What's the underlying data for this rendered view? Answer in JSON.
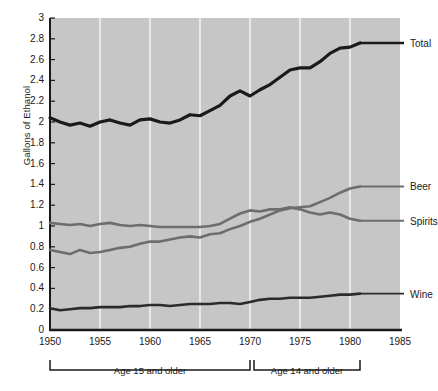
{
  "chart_data": {
    "type": "line",
    "title": "",
    "xlabel": "",
    "ylabel": "Gallons of Ethanol",
    "xlim": [
      1950,
      1985
    ],
    "ylim": [
      0,
      3
    ],
    "grid": "vertical-white-at-5-year-ticks",
    "legend_position": "right-of-line-ends",
    "x_ticks": [
      1950,
      1955,
      1960,
      1965,
      1970,
      1975,
      1980,
      1985
    ],
    "y_ticks": [
      0,
      0.2,
      0.4,
      0.6,
      0.8,
      1,
      1.2,
      1.4,
      1.6,
      1.8,
      2,
      2.2,
      2.4,
      2.6,
      2.8,
      3
    ],
    "y_tick_labels": [
      "0",
      "0.2",
      "0.4",
      "0.6",
      "0.8",
      "1",
      "1.2",
      "1.4",
      "1.6",
      "1.8",
      "2",
      "2.2",
      "2.4",
      "2.6",
      "2.8",
      "3"
    ],
    "x": [
      1950,
      1951,
      1952,
      1953,
      1954,
      1955,
      1956,
      1957,
      1958,
      1959,
      1960,
      1961,
      1962,
      1963,
      1964,
      1965,
      1966,
      1967,
      1968,
      1969,
      1970,
      1971,
      1972,
      1973,
      1974,
      1975,
      1976,
      1977,
      1978,
      1979,
      1980,
      1981
    ],
    "series": [
      {
        "name": "Total",
        "color": "#1a1a1a",
        "width": 3.2,
        "label": "Total",
        "values": [
          2.04,
          2.0,
          1.97,
          1.99,
          1.96,
          2.0,
          2.02,
          1.99,
          1.97,
          2.02,
          2.03,
          2.0,
          1.99,
          2.02,
          2.07,
          2.06,
          2.11,
          2.16,
          2.25,
          2.3,
          2.25,
          2.31,
          2.36,
          2.43,
          2.5,
          2.52,
          2.52,
          2.58,
          2.66,
          2.71,
          2.72,
          2.76
        ]
      },
      {
        "name": "Beer",
        "color": "#6d6d6d",
        "width": 2.6,
        "label": "Beer",
        "values": [
          0.77,
          0.75,
          0.73,
          0.77,
          0.74,
          0.75,
          0.77,
          0.79,
          0.8,
          0.83,
          0.85,
          0.85,
          0.87,
          0.89,
          0.9,
          0.89,
          0.92,
          0.93,
          0.97,
          1.0,
          1.04,
          1.07,
          1.11,
          1.15,
          1.17,
          1.18,
          1.19,
          1.23,
          1.27,
          1.32,
          1.36,
          1.38
        ]
      },
      {
        "name": "Spirits",
        "color": "#6d6d6d",
        "width": 2.6,
        "label": "Spirits",
        "values": [
          1.03,
          1.02,
          1.01,
          1.02,
          1.0,
          1.02,
          1.03,
          1.01,
          1.0,
          1.01,
          1.0,
          0.99,
          0.99,
          0.99,
          0.99,
          0.99,
          1.0,
          1.02,
          1.07,
          1.12,
          1.15,
          1.14,
          1.16,
          1.16,
          1.18,
          1.16,
          1.13,
          1.11,
          1.13,
          1.11,
          1.07,
          1.05
        ]
      },
      {
        "name": "Wine",
        "color": "#2b2b2b",
        "width": 2.6,
        "label": "Wine",
        "values": [
          0.21,
          0.19,
          0.2,
          0.21,
          0.21,
          0.22,
          0.22,
          0.22,
          0.23,
          0.23,
          0.24,
          0.24,
          0.23,
          0.24,
          0.25,
          0.25,
          0.25,
          0.26,
          0.26,
          0.25,
          0.27,
          0.29,
          0.3,
          0.3,
          0.31,
          0.31,
          0.31,
          0.32,
          0.33,
          0.34,
          0.34,
          0.35
        ]
      }
    ],
    "annotations": [
      {
        "text": "Age 15 and older",
        "x_start": 1950,
        "x_end": 1970
      },
      {
        "text": "Age 14 and older",
        "x_start": 1970.4,
        "x_end": 1981
      }
    ],
    "plot_background": "#c6c6c6",
    "gridline_color": "#f2f2f2",
    "axis_color": "#1a1a1a"
  }
}
